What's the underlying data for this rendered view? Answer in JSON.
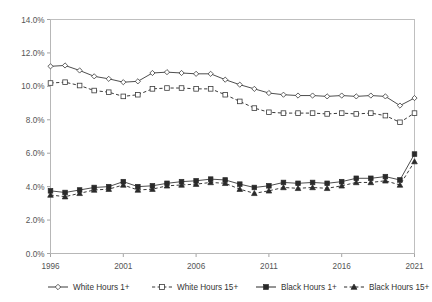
{
  "chart_data": {
    "type": "line",
    "title": "",
    "subtitle": "",
    "xlabel": "",
    "ylabel": "",
    "xlim": [
      1996,
      2021
    ],
    "ylim": [
      0.0,
      14.0
    ],
    "y_tick_labels": [
      "0.0%",
      "2.0%",
      "4.0%",
      "6.0%",
      "8.0%",
      "10.0%",
      "12.0%",
      "14.0%"
    ],
    "y_tick_values": [
      0.0,
      2.0,
      4.0,
      6.0,
      8.0,
      10.0,
      12.0,
      14.0
    ],
    "x_tick_labels": [
      "1996",
      "2001",
      "2006",
      "2011",
      "2016",
      "2021"
    ],
    "x_tick_values": [
      1996,
      2001,
      2006,
      2011,
      2016,
      2021
    ],
    "grid": false,
    "legend_position": "bottom",
    "x": [
      1996,
      1997,
      1998,
      1999,
      2000,
      2001,
      2002,
      2003,
      2004,
      2005,
      2006,
      2007,
      2008,
      2009,
      2010,
      2011,
      2012,
      2013,
      2014,
      2015,
      2016,
      2017,
      2018,
      2019,
      2020,
      2021
    ],
    "series": [
      {
        "name": "White Hours 1+",
        "marker": "diamond-open",
        "line_style": "solid",
        "color": "#3a3a3a",
        "values": [
          11.2,
          11.25,
          10.95,
          10.6,
          10.45,
          10.25,
          10.3,
          10.8,
          10.85,
          10.8,
          10.75,
          10.75,
          10.4,
          10.1,
          9.85,
          9.6,
          9.5,
          9.45,
          9.45,
          9.4,
          9.45,
          9.4,
          9.45,
          9.4,
          8.85,
          9.3
        ]
      },
      {
        "name": "White Hours 15+",
        "marker": "square-open",
        "line_style": "dashed",
        "color": "#3a3a3a",
        "values": [
          10.2,
          10.25,
          10.05,
          9.75,
          9.65,
          9.4,
          9.5,
          9.85,
          9.9,
          9.9,
          9.85,
          9.85,
          9.5,
          9.1,
          8.7,
          8.45,
          8.4,
          8.4,
          8.4,
          8.35,
          8.4,
          8.35,
          8.4,
          8.25,
          7.85,
          8.4
        ]
      },
      {
        "name": "Black Hours 1+",
        "marker": "square-solid",
        "line_style": "solid",
        "color": "#2a2a2a",
        "values": [
          3.75,
          3.65,
          3.8,
          3.95,
          4.0,
          4.3,
          4.0,
          4.05,
          4.2,
          4.3,
          4.35,
          4.45,
          4.4,
          4.15,
          3.95,
          4.05,
          4.25,
          4.2,
          4.25,
          4.2,
          4.3,
          4.5,
          4.5,
          4.6,
          4.4,
          5.95
        ]
      },
      {
        "name": "Black Hours 15+",
        "marker": "triangle-solid",
        "line_style": "dashed",
        "color": "#2a2a2a",
        "values": [
          3.5,
          3.4,
          3.6,
          3.8,
          3.85,
          4.1,
          3.8,
          3.85,
          4.05,
          4.1,
          4.15,
          4.25,
          4.2,
          3.85,
          3.6,
          3.75,
          3.95,
          3.9,
          3.95,
          3.9,
          4.05,
          4.25,
          4.25,
          4.35,
          4.1,
          5.5
        ]
      }
    ]
  },
  "legend": {
    "items": [
      {
        "label": "White Hours 1+"
      },
      {
        "label": "White Hours 15+"
      },
      {
        "label": "Black Hours 1+"
      },
      {
        "label": "Black Hours 15+"
      }
    ]
  }
}
